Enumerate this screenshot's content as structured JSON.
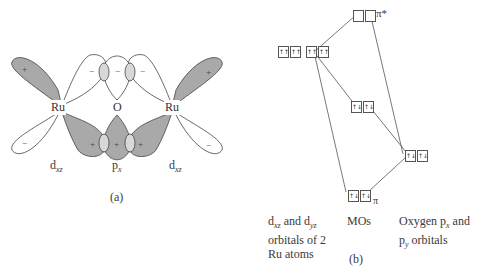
{
  "panel_a": {
    "caption": "(a)",
    "atoms": {
      "ru_left": "Ru",
      "oxygen": "O",
      "ru_right": "Ru"
    },
    "orbital_labels": {
      "left": {
        "base": "d",
        "sub": "xz"
      },
      "center": {
        "base": "p",
        "sub": "x"
      },
      "right": {
        "base": "d",
        "sub": "xz"
      }
    },
    "signs": {
      "plus": "+",
      "minus": "−"
    },
    "colors": {
      "shaded_lobe": "#a9a9a9",
      "overlap": "#d8d8d8",
      "outline": "#444444"
    }
  },
  "panel_b": {
    "caption": "(b)",
    "levels": {
      "pi_star": {
        "label": "π*",
        "electrons": [
          "",
          ""
        ]
      },
      "ru_d": {
        "electrons": [
          "↑↑",
          "↑↑"
        ]
      },
      "nonbonding": {
        "electrons": [
          "↑↓",
          "↑↓"
        ]
      },
      "oxygen_p": {
        "electrons": [
          "↑↓",
          "↑↓"
        ]
      },
      "pi": {
        "label": "π",
        "electrons": [
          "↑↓",
          "↑↓"
        ]
      }
    },
    "column_labels": {
      "left_line1_a": "d",
      "left_line1_sub1": "xz",
      "left_line1_mid": " and d",
      "left_line1_sub2": "yz",
      "left_line2": "orbitals of 2",
      "left_line3": "Ru atoms",
      "middle": "MOs",
      "right_line1_a": "Oxygen p",
      "right_line1_sub": "x",
      "right_line1_b": " and",
      "right_line2_a": "p",
      "right_line2_sub": "y",
      "right_line2_b": " orbitals"
    }
  }
}
